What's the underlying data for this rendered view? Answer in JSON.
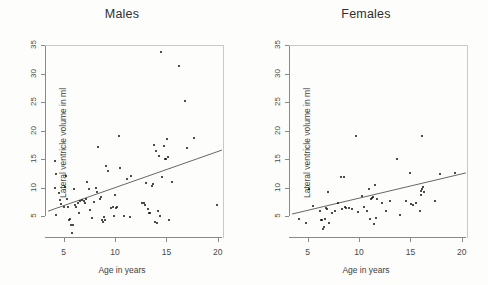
{
  "figure": {
    "background": "#fdfdfb",
    "point_color": "#111111",
    "line_color": "#555555",
    "axis_color": "#8a8a8a"
  },
  "chart_data": [
    {
      "type": "scatter",
      "title": "Males",
      "xlabel": "Age in years",
      "ylabel": "Lateral ventricle volume in ml",
      "xlim": [
        3.2,
        20.6
      ],
      "ylim": [
        1.2,
        35.0
      ],
      "xticks": [
        5,
        10,
        15,
        20
      ],
      "yticks": [
        5,
        10,
        15,
        20,
        25,
        30,
        35
      ],
      "grid": false,
      "legend": "none",
      "fit_line": {
        "x": [
          3.5,
          20.4
        ],
        "y": [
          5.9,
          16.6
        ]
      },
      "points": [
        [
          4.2,
          14.6
        ],
        [
          4.3,
          12.4
        ],
        [
          4.2,
          10.0
        ],
        [
          4.3,
          5.3
        ],
        [
          4.6,
          9.0
        ],
        [
          4.7,
          7.9
        ],
        [
          4.8,
          7.2
        ],
        [
          5.0,
          6.7
        ],
        [
          5.1,
          10.1
        ],
        [
          5.2,
          12.0
        ],
        [
          5.3,
          8.1
        ],
        [
          5.4,
          6.6
        ],
        [
          5.5,
          4.3
        ],
        [
          5.6,
          4.5
        ],
        [
          5.7,
          3.5
        ],
        [
          5.8,
          2.1
        ],
        [
          5.9,
          3.4
        ],
        [
          6.0,
          9.8
        ],
        [
          6.1,
          6.9
        ],
        [
          6.2,
          6.7
        ],
        [
          6.4,
          7.4
        ],
        [
          6.5,
          5.6
        ],
        [
          6.6,
          7.7
        ],
        [
          6.8,
          7.8
        ],
        [
          7.0,
          7.7
        ],
        [
          7.1,
          7.4
        ],
        [
          7.2,
          8.0
        ],
        [
          7.3,
          11.0
        ],
        [
          7.5,
          9.8
        ],
        [
          7.6,
          6.1
        ],
        [
          7.8,
          4.7
        ],
        [
          8.0,
          7.5
        ],
        [
          8.2,
          10.0
        ],
        [
          8.3,
          9.3
        ],
        [
          8.4,
          17.2
        ],
        [
          8.5,
          8.1
        ],
        [
          8.6,
          8.4
        ],
        [
          8.7,
          4.3
        ],
        [
          8.8,
          4.0
        ],
        [
          8.9,
          4.8
        ],
        [
          9.0,
          4.3
        ],
        [
          9.1,
          13.8
        ],
        [
          9.3,
          12.9
        ],
        [
          9.6,
          6.5
        ],
        [
          9.8,
          6.7
        ],
        [
          9.9,
          5.0
        ],
        [
          10.0,
          8.8
        ],
        [
          10.1,
          6.5
        ],
        [
          10.2,
          6.6
        ],
        [
          10.4,
          19.0
        ],
        [
          10.5,
          13.4
        ],
        [
          10.9,
          5.1
        ],
        [
          11.2,
          11.5
        ],
        [
          11.5,
          4.9
        ],
        [
          11.6,
          12.0
        ],
        [
          12.6,
          7.4
        ],
        [
          12.8,
          7.3
        ],
        [
          12.9,
          6.9
        ],
        [
          13.0,
          10.8
        ],
        [
          13.2,
          6.3
        ],
        [
          13.3,
          5.6
        ],
        [
          13.4,
          5.5
        ],
        [
          13.6,
          10.3
        ],
        [
          13.7,
          10.6
        ],
        [
          13.8,
          17.5
        ],
        [
          13.9,
          4.0
        ],
        [
          14.0,
          16.4
        ],
        [
          14.1,
          3.8
        ],
        [
          14.2,
          5.9
        ],
        [
          14.3,
          15.6
        ],
        [
          14.4,
          5.1
        ],
        [
          14.5,
          33.7
        ],
        [
          14.6,
          11.9
        ],
        [
          14.8,
          17.3
        ],
        [
          14.9,
          15.0
        ],
        [
          15.0,
          15.1
        ],
        [
          15.1,
          18.5
        ],
        [
          15.2,
          15.3
        ],
        [
          15.3,
          4.4
        ],
        [
          15.5,
          11.0
        ],
        [
          16.2,
          31.4
        ],
        [
          16.8,
          25.2
        ],
        [
          17.0,
          17.0
        ],
        [
          17.7,
          18.7
        ],
        [
          19.9,
          7.0
        ]
      ]
    },
    {
      "type": "scatter",
      "title": "Females",
      "xlabel": "Age in years",
      "ylabel": "Lateral ventricle volume in ml",
      "xlim": [
        3.2,
        20.6
      ],
      "ylim": [
        1.2,
        35.0
      ],
      "xticks": [
        5,
        10,
        15,
        20
      ],
      "yticks": [
        5,
        10,
        15,
        20,
        25,
        30,
        35
      ],
      "grid": false,
      "legend": "none",
      "fit_line": {
        "x": [
          3.5,
          20.4
        ],
        "y": [
          5.4,
          12.6
        ]
      },
      "points": [
        [
          4.2,
          4.6
        ],
        [
          4.9,
          3.9
        ],
        [
          5.1,
          9.7
        ],
        [
          5.5,
          6.8
        ],
        [
          6.2,
          6.0
        ],
        [
          6.3,
          4.4
        ],
        [
          6.4,
          4.3
        ],
        [
          6.5,
          2.7
        ],
        [
          6.6,
          3.1
        ],
        [
          6.7,
          4.6
        ],
        [
          6.8,
          6.4
        ],
        [
          6.9,
          6.3
        ],
        [
          7.0,
          9.2
        ],
        [
          7.1,
          3.8
        ],
        [
          7.4,
          5.6
        ],
        [
          7.7,
          6.0
        ],
        [
          8.0,
          7.3
        ],
        [
          8.3,
          11.9
        ],
        [
          8.4,
          6.2
        ],
        [
          8.5,
          11.9
        ],
        [
          8.6,
          6.6
        ],
        [
          8.7,
          6.5
        ],
        [
          9.0,
          6.5
        ],
        [
          9.3,
          6.3
        ],
        [
          9.7,
          19.0
        ],
        [
          9.9,
          5.8
        ],
        [
          10.3,
          8.6
        ],
        [
          10.5,
          6.6
        ],
        [
          10.8,
          6.0
        ],
        [
          11.0,
          9.7
        ],
        [
          11.1,
          4.6
        ],
        [
          11.2,
          8.1
        ],
        [
          11.3,
          8.2
        ],
        [
          11.4,
          8.3
        ],
        [
          11.5,
          3.7
        ],
        [
          11.6,
          10.4
        ],
        [
          11.7,
          4.7
        ],
        [
          11.8,
          8.0
        ],
        [
          12.2,
          7.3
        ],
        [
          12.6,
          6.0
        ],
        [
          13.0,
          7.6
        ],
        [
          13.7,
          15.0
        ],
        [
          14.0,
          5.2
        ],
        [
          14.6,
          7.7
        ],
        [
          15.0,
          12.6
        ],
        [
          15.1,
          7.2
        ],
        [
          15.3,
          6.9
        ],
        [
          15.5,
          7.3
        ],
        [
          15.9,
          5.9
        ],
        [
          16.0,
          9.5
        ],
        [
          16.1,
          9.8
        ],
        [
          16.2,
          10.2
        ],
        [
          16.1,
          19.0
        ],
        [
          16.3,
          9.3
        ],
        [
          16.0,
          8.8
        ],
        [
          17.4,
          7.6
        ],
        [
          17.9,
          12.4
        ],
        [
          19.3,
          12.5
        ]
      ]
    }
  ]
}
